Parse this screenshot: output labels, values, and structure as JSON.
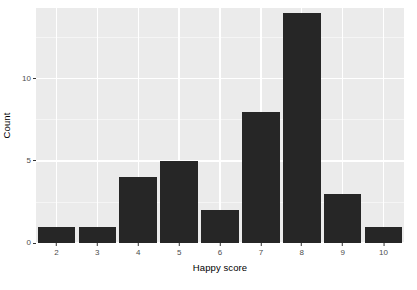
{
  "chart_data": {
    "type": "bar",
    "title": "",
    "subtitle": "",
    "xlabel": "Happy score",
    "ylabel": "Count",
    "categories": [
      "2",
      "3",
      "4",
      "5",
      "6",
      "7",
      "8",
      "9",
      "10"
    ],
    "values": [
      1,
      1,
      4,
      5,
      2,
      8,
      14,
      3,
      1
    ],
    "series": [
      {
        "name": "Count",
        "values": [
          1,
          1,
          4,
          5,
          2,
          8,
          14,
          3,
          1
        ]
      }
    ],
    "xlim": [
      1.5,
      10.5
    ],
    "ylim": [
      0,
      14.3
    ],
    "x_tick_labels": [
      "2",
      "3",
      "4",
      "5",
      "6",
      "7",
      "8",
      "9",
      "10"
    ],
    "x_tick_values": [
      2,
      3,
      4,
      5,
      6,
      7,
      8,
      9,
      10
    ],
    "y_tick_labels": [
      "0",
      "5",
      "10"
    ],
    "y_tick_values": [
      0,
      5,
      10
    ],
    "grid": true,
    "grid_major_color": "#ffffff",
    "grid_minor_color": "#f5f5f5",
    "panel_background": "#ebebeb",
    "bar_color": "#262626",
    "legend": null,
    "legend_position": "none",
    "annotations": []
  },
  "axes": {
    "y_title": "Count",
    "x_title": "Happy score"
  }
}
